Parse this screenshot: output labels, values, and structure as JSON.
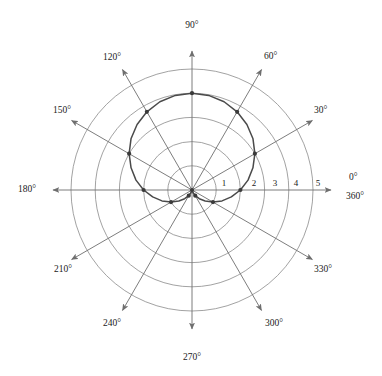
{
  "figure": {
    "title": "",
    "background_color": "#ffffff",
    "grid_color": "#8a8a8a",
    "spoke_color": "#6e6e6e",
    "curve_color": "#4a4a4a",
    "marker_color": "#3a3a3a",
    "text_color": "#1a1a1a"
  },
  "chart_data": {
    "type": "line",
    "projection": "polar",
    "title": "",
    "xlabel": "",
    "ylabel": "",
    "grid": true,
    "legend": false,
    "angular_unit": "degrees",
    "angular_direction": "counterclockwise",
    "angular_zero_location": "E",
    "angular_range": [
      0,
      360
    ],
    "angular_tick_labels": [
      "0°",
      "360°",
      "30°",
      "60°",
      "90°",
      "120°",
      "150°",
      "180°",
      "210°",
      "240°",
      "270°",
      "300°",
      "330°"
    ],
    "angular_ticks": [
      0,
      30,
      60,
      90,
      120,
      150,
      180,
      210,
      240,
      270,
      300,
      330
    ],
    "radial_range": [
      0,
      5
    ],
    "radial_ticks": [
      1,
      2,
      3,
      4,
      5
    ],
    "radial_tick_labels": [
      "1",
      "2",
      "3",
      "4",
      "5"
    ],
    "equation": "r = 2 + 2 sin(theta)",
    "theta": [
      0,
      10,
      20,
      30,
      40,
      50,
      60,
      70,
      80,
      90,
      100,
      110,
      120,
      130,
      140,
      150,
      160,
      170,
      180,
      190,
      200,
      210,
      220,
      230,
      240,
      250,
      260,
      270,
      280,
      290,
      300,
      310,
      320,
      330,
      340,
      350,
      360
    ],
    "r": [
      2.0,
      2.35,
      2.68,
      3.0,
      3.29,
      3.53,
      3.73,
      3.88,
      3.97,
      4.0,
      3.97,
      3.88,
      3.73,
      3.53,
      3.29,
      3.0,
      2.68,
      2.35,
      2.0,
      1.65,
      1.32,
      1.0,
      0.71,
      0.47,
      0.27,
      0.12,
      0.03,
      0.0,
      0.03,
      0.12,
      0.27,
      0.47,
      0.71,
      1.0,
      1.32,
      1.65,
      2.0
    ],
    "markers": {
      "theta": [
        0,
        30,
        60,
        90,
        120,
        150,
        180,
        210,
        240,
        270,
        300,
        330
      ],
      "r": [
        2.0,
        3.0,
        3.73,
        4.0,
        3.73,
        3.0,
        2.0,
        1.0,
        0.27,
        0.0,
        0.27,
        1.0
      ]
    }
  },
  "angle_axes": [
    {
      "name": "angle-axis-0",
      "angle": 0,
      "label": "0°",
      "label_x": 349,
      "label_y": 180,
      "anchor": "start"
    },
    {
      "name": "angle-axis-360",
      "angle": 0,
      "label": "360°",
      "label_x": 346,
      "label_y": 199,
      "anchor": "start"
    },
    {
      "name": "angle-axis-30",
      "angle": 30,
      "label": "30°",
      "label_x": 314,
      "label_y": 113,
      "anchor": "start"
    },
    {
      "name": "angle-axis-60",
      "angle": 60,
      "label": "60°",
      "label_x": 264,
      "label_y": 59,
      "anchor": "start"
    },
    {
      "name": "angle-axis-90",
      "angle": 90,
      "label": "90°",
      "label_x": 192,
      "label_y": 28,
      "anchor": "middle"
    },
    {
      "name": "angle-axis-120",
      "angle": 120,
      "label": "120°",
      "label_x": 121,
      "label_y": 60,
      "anchor": "end"
    },
    {
      "name": "angle-axis-150",
      "angle": 150,
      "label": "150°",
      "label_x": 71,
      "label_y": 113,
      "anchor": "end"
    },
    {
      "name": "angle-axis-180",
      "angle": 180,
      "label": "180°",
      "label_x": 36,
      "label_y": 192,
      "anchor": "end"
    },
    {
      "name": "angle-axis-210",
      "angle": 210,
      "label": "210°",
      "label_x": 72,
      "label_y": 272,
      "anchor": "end"
    },
    {
      "name": "angle-axis-240",
      "angle": 240,
      "label": "240°",
      "label_x": 121,
      "label_y": 326,
      "anchor": "end"
    },
    {
      "name": "angle-axis-270",
      "angle": 270,
      "label": "270°",
      "label_x": 192,
      "label_y": 360,
      "anchor": "middle"
    },
    {
      "name": "angle-axis-300",
      "angle": 300,
      "label": "300°",
      "label_x": 265,
      "label_y": 326,
      "anchor": "start"
    },
    {
      "name": "angle-axis-330",
      "angle": 330,
      "label": "330°",
      "label_x": 314,
      "label_y": 272,
      "anchor": "start"
    }
  ],
  "radial_axis": {
    "labels": [
      {
        "value": "1",
        "x": 224,
        "y": 186
      },
      {
        "value": "2",
        "x": 254,
        "y": 186
      },
      {
        "value": "3",
        "x": 275,
        "y": 186
      },
      {
        "value": "4",
        "x": 296,
        "y": 186
      },
      {
        "value": "5",
        "x": 318,
        "y": 186
      }
    ]
  }
}
